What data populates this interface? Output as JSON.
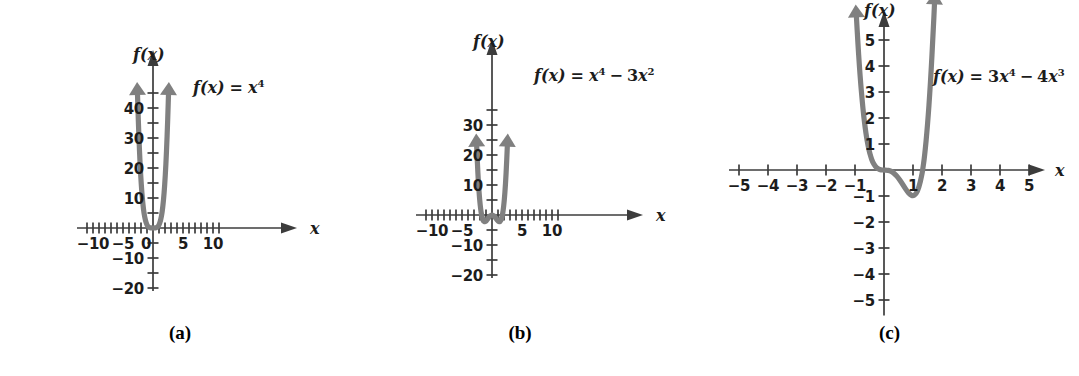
{
  "figure": {
    "background_color": "#ffffff",
    "curve_color": "#808080",
    "axis_color": "#3c3c3c"
  },
  "chart_data": [
    {
      "type": "line",
      "panel": "a",
      "caption": "(a)",
      "equation_label": "f(x) = x⁴",
      "equation_parts": {
        "lhs": "f",
        "arg": "(x)",
        "eq": "=",
        "base1": "x",
        "exp1": "4"
      },
      "title": "",
      "xlabel": "x",
      "ylabel": "f(x)",
      "xlim": [
        -12,
        12
      ],
      "ylim": [
        -24,
        46
      ],
      "xticks": [
        -11,
        -10,
        -9,
        -8,
        -7,
        -6,
        -5,
        -4,
        -3,
        -2,
        -1,
        0,
        1,
        2,
        3,
        4,
        5,
        6,
        7,
        8,
        9,
        10,
        11
      ],
      "xtick_step": 1,
      "xtick_labels": [
        {
          "value": -10,
          "text": "−10"
        },
        {
          "value": -5,
          "text": "−5"
        },
        {
          "value": 0,
          "text": "0"
        },
        {
          "value": 5,
          "text": "5"
        },
        {
          "value": 10,
          "text": "10"
        }
      ],
      "yticks": [
        -20,
        -15,
        -10,
        -5,
        5,
        10,
        15,
        20,
        25,
        30,
        35,
        40,
        45
      ],
      "ytick_step": 5,
      "ytick_labels": [
        {
          "value": 40,
          "text": "40"
        },
        {
          "value": 30,
          "text": "30"
        },
        {
          "value": 20,
          "text": "20"
        },
        {
          "value": 10,
          "text": "10"
        },
        {
          "value": -10,
          "text": "−10"
        },
        {
          "value": -20,
          "text": "−20"
        }
      ],
      "function": "x^4",
      "grid": false,
      "points": [
        {
          "x": -2.58,
          "y": 44.3
        },
        {
          "x": -2.5,
          "y": 39.1
        },
        {
          "x": -2.4,
          "y": 33.2
        },
        {
          "x": -2.3,
          "y": 28.0
        },
        {
          "x": -2.2,
          "y": 23.4
        },
        {
          "x": -2.1,
          "y": 19.4
        },
        {
          "x": -2.0,
          "y": 16.0
        },
        {
          "x": -1.9,
          "y": 13.0
        },
        {
          "x": -1.8,
          "y": 10.5
        },
        {
          "x": -1.7,
          "y": 8.35
        },
        {
          "x": -1.6,
          "y": 6.55
        },
        {
          "x": -1.5,
          "y": 5.06
        },
        {
          "x": -1.4,
          "y": 3.84
        },
        {
          "x": -1.2,
          "y": 2.07
        },
        {
          "x": -1.0,
          "y": 1.0
        },
        {
          "x": -0.8,
          "y": 0.41
        },
        {
          "x": -0.6,
          "y": 0.13
        },
        {
          "x": -0.4,
          "y": 0.03
        },
        {
          "x": -0.2,
          "y": 0.0
        },
        {
          "x": 0.0,
          "y": 0.0
        },
        {
          "x": 0.2,
          "y": 0.0
        },
        {
          "x": 0.4,
          "y": 0.03
        },
        {
          "x": 0.6,
          "y": 0.13
        },
        {
          "x": 0.8,
          "y": 0.41
        },
        {
          "x": 1.0,
          "y": 1.0
        },
        {
          "x": 1.2,
          "y": 2.07
        },
        {
          "x": 1.4,
          "y": 3.84
        },
        {
          "x": 1.5,
          "y": 5.06
        },
        {
          "x": 1.6,
          "y": 6.55
        },
        {
          "x": 1.7,
          "y": 8.35
        },
        {
          "x": 1.8,
          "y": 10.5
        },
        {
          "x": 1.9,
          "y": 13.0
        },
        {
          "x": 2.0,
          "y": 16.0
        },
        {
          "x": 2.1,
          "y": 19.4
        },
        {
          "x": 2.2,
          "y": 23.4
        },
        {
          "x": 2.3,
          "y": 28.0
        },
        {
          "x": 2.4,
          "y": 33.2
        },
        {
          "x": 2.5,
          "y": 39.1
        },
        {
          "x": 2.58,
          "y": 44.3
        }
      ]
    },
    {
      "type": "line",
      "panel": "b",
      "caption": "(b)",
      "equation_label": "f(x) = x⁴ − 3x²",
      "equation_parts": {
        "lhs": "f",
        "arg": "(x)",
        "eq": "=",
        "base1": "x",
        "exp1": "4",
        "op": "−",
        "coef2": "3",
        "base2": "x",
        "exp2": "2"
      },
      "title": "",
      "xlabel": "x",
      "ylabel": "f(x)",
      "xlim": [
        -12,
        12
      ],
      "ylim": [
        -24,
        36
      ],
      "xticks": [
        -11,
        -10,
        -9,
        -8,
        -7,
        -6,
        -5,
        -4,
        -3,
        -2,
        -1,
        0,
        1,
        2,
        3,
        4,
        5,
        6,
        7,
        8,
        9,
        10,
        11
      ],
      "xtick_step": 1,
      "xtick_labels": [
        {
          "value": -10,
          "text": "−10"
        },
        {
          "value": -5,
          "text": "−5"
        },
        {
          "value": 5,
          "text": "5"
        },
        {
          "value": 10,
          "text": "10"
        }
      ],
      "yticks": [
        -20,
        -15,
        -10,
        -5,
        5,
        10,
        15,
        20,
        25,
        30,
        35
      ],
      "ytick_step": 5,
      "ytick_labels": [
        {
          "value": 30,
          "text": "30"
        },
        {
          "value": 20,
          "text": "20"
        },
        {
          "value": 10,
          "text": "10"
        },
        {
          "value": -10,
          "text": "−10"
        },
        {
          "value": -20,
          "text": "−20"
        }
      ],
      "function": "x^4 - 3x^2",
      "grid": false,
      "points": [
        {
          "x": -2.55,
          "y": 22.8
        },
        {
          "x": -2.5,
          "y": 20.3
        },
        {
          "x": -2.4,
          "y": 15.9
        },
        {
          "x": -2.3,
          "y": 12.1
        },
        {
          "x": -2.2,
          "y": 8.9
        },
        {
          "x": -2.1,
          "y": 6.2
        },
        {
          "x": -2.0,
          "y": 4.0
        },
        {
          "x": -1.9,
          "y": 2.2
        },
        {
          "x": -1.8,
          "y": 0.77
        },
        {
          "x": -1.73,
          "y": 0.0
        },
        {
          "x": -1.6,
          "y": -1.12
        },
        {
          "x": -1.5,
          "y": -1.69
        },
        {
          "x": -1.4,
          "y": -2.04
        },
        {
          "x": -1.3,
          "y": -2.21
        },
        {
          "x": -1.22,
          "y": -2.25
        },
        {
          "x": -1.1,
          "y": -2.17
        },
        {
          "x": -1.0,
          "y": -2.0
        },
        {
          "x": -0.9,
          "y": -1.77
        },
        {
          "x": -0.8,
          "y": -1.51
        },
        {
          "x": -0.6,
          "y": -0.95
        },
        {
          "x": -0.4,
          "y": -0.45
        },
        {
          "x": -0.2,
          "y": -0.12
        },
        {
          "x": 0.0,
          "y": 0.0
        },
        {
          "x": 0.2,
          "y": -0.12
        },
        {
          "x": 0.4,
          "y": -0.45
        },
        {
          "x": 0.6,
          "y": -0.95
        },
        {
          "x": 0.8,
          "y": -1.51
        },
        {
          "x": 0.9,
          "y": -1.77
        },
        {
          "x": 1.0,
          "y": -2.0
        },
        {
          "x": 1.1,
          "y": -2.17
        },
        {
          "x": 1.22,
          "y": -2.25
        },
        {
          "x": 1.3,
          "y": -2.21
        },
        {
          "x": 1.4,
          "y": -2.04
        },
        {
          "x": 1.5,
          "y": -1.69
        },
        {
          "x": 1.6,
          "y": -1.12
        },
        {
          "x": 1.73,
          "y": 0.0
        },
        {
          "x": 1.8,
          "y": 0.77
        },
        {
          "x": 1.9,
          "y": 2.2
        },
        {
          "x": 2.0,
          "y": 4.0
        },
        {
          "x": 2.1,
          "y": 6.2
        },
        {
          "x": 2.2,
          "y": 8.9
        },
        {
          "x": 2.3,
          "y": 12.1
        },
        {
          "x": 2.4,
          "y": 15.9
        },
        {
          "x": 2.5,
          "y": 20.3
        },
        {
          "x": 2.55,
          "y": 22.8
        }
      ]
    },
    {
      "type": "line",
      "panel": "c",
      "caption": "(c)",
      "equation_label": "f(x) = 3x⁴ − 4x³",
      "equation_parts": {
        "lhs": "f",
        "arg": "(x)",
        "eq": "=",
        "coef1": "3",
        "base1": "x",
        "exp1": "4",
        "op": "−",
        "coef2": "4",
        "base2": "x",
        "exp2": "3"
      },
      "title": "",
      "xlabel": "x",
      "ylabel": "f(x)",
      "xlim": [
        -5.8,
        5.8
      ],
      "ylim": [
        -5.8,
        5.8
      ],
      "xticks": [
        -5,
        -4,
        -3,
        -2,
        -1,
        0,
        1,
        2,
        3,
        4,
        5
      ],
      "xtick_step": 1,
      "xtick_labels": [
        {
          "value": -5,
          "text": "−5"
        },
        {
          "value": -4,
          "text": "−4"
        },
        {
          "value": -3,
          "text": "−3"
        },
        {
          "value": -2,
          "text": "−2"
        },
        {
          "value": -1,
          "text": "−1"
        },
        {
          "value": 1,
          "text": "1"
        },
        {
          "value": 2,
          "text": "2"
        },
        {
          "value": 3,
          "text": "3"
        },
        {
          "value": 4,
          "text": "4"
        },
        {
          "value": 5,
          "text": "5"
        }
      ],
      "yticks": [
        -5,
        -4,
        -3,
        -2,
        -1,
        1,
        2,
        3,
        4,
        5
      ],
      "ytick_step": 1,
      "ytick_labels": [
        {
          "value": 5,
          "text": "5"
        },
        {
          "value": 4,
          "text": "4"
        },
        {
          "value": 3,
          "text": "3"
        },
        {
          "value": 2,
          "text": "2"
        },
        {
          "value": 1,
          "text": "1"
        },
        {
          "value": -1,
          "text": "−1"
        },
        {
          "value": -2,
          "text": "−2"
        },
        {
          "value": -3,
          "text": "−3"
        },
        {
          "value": -4,
          "text": "−4"
        },
        {
          "value": -5,
          "text": "−5"
        }
      ],
      "function": "3x^4 - 4x^3",
      "grid": false,
      "points": [
        {
          "x": -0.95,
          "y": 5.87
        },
        {
          "x": -0.9,
          "y": 4.88
        },
        {
          "x": -0.85,
          "y": 4.02
        },
        {
          "x": -0.8,
          "y": 3.28
        },
        {
          "x": -0.75,
          "y": 2.64
        },
        {
          "x": -0.7,
          "y": 2.09
        },
        {
          "x": -0.65,
          "y": 1.63
        },
        {
          "x": -0.6,
          "y": 1.25
        },
        {
          "x": -0.55,
          "y": 0.94
        },
        {
          "x": -0.5,
          "y": 0.69
        },
        {
          "x": -0.45,
          "y": 0.49
        },
        {
          "x": -0.4,
          "y": 0.33
        },
        {
          "x": -0.3,
          "y": 0.13
        },
        {
          "x": -0.2,
          "y": 0.04
        },
        {
          "x": -0.1,
          "y": 0.0
        },
        {
          "x": 0.0,
          "y": 0.0
        },
        {
          "x": 0.1,
          "y": -0.004
        },
        {
          "x": 0.2,
          "y": -0.027
        },
        {
          "x": 0.3,
          "y": -0.084
        },
        {
          "x": 0.4,
          "y": -0.18
        },
        {
          "x": 0.5,
          "y": -0.31
        },
        {
          "x": 0.6,
          "y": -0.47
        },
        {
          "x": 0.7,
          "y": -0.65
        },
        {
          "x": 0.8,
          "y": -0.82
        },
        {
          "x": 0.9,
          "y": -0.95
        },
        {
          "x": 1.0,
          "y": -1.0
        },
        {
          "x": 1.1,
          "y": -0.93
        },
        {
          "x": 1.2,
          "y": -0.69
        },
        {
          "x": 1.3,
          "y": -0.22
        },
        {
          "x": 1.333,
          "y": 0.0
        },
        {
          "x": 1.4,
          "y": 0.53
        },
        {
          "x": 1.5,
          "y": 1.69
        },
        {
          "x": 1.6,
          "y": 3.28
        },
        {
          "x": 1.7,
          "y": 5.38
        },
        {
          "x": 1.74,
          "y": 6.37
        }
      ]
    }
  ]
}
